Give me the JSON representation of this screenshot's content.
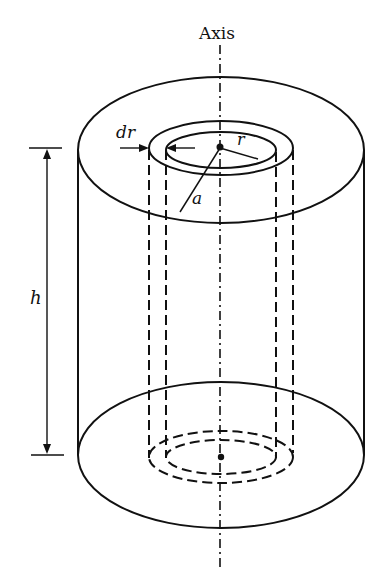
{
  "diagram": {
    "labels": {
      "axis": "Axis",
      "dr": "dr",
      "r": "r",
      "a": "a",
      "h": "h"
    },
    "colors": {
      "stroke": "#111111",
      "background": "#ffffff"
    }
  }
}
